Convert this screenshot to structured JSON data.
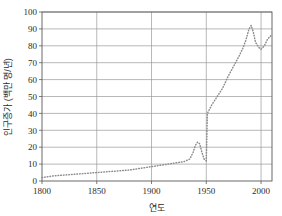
{
  "chart_data": {
    "type": "line",
    "title": "",
    "xlabel": "연도",
    "ylabel": "인구증가 (백만 명/년)",
    "xlim": [
      1800,
      2010
    ],
    "ylim": [
      0,
      100
    ],
    "xticks": [
      1800,
      1850,
      1900,
      1950,
      2000
    ],
    "yticks": [
      0,
      10,
      20,
      30,
      40,
      50,
      60,
      70,
      80,
      90,
      100
    ],
    "grid": "horizontal-and-vertical",
    "legend": "none",
    "line_style": "dotted",
    "line_color": "#8d8d8d",
    "series": [
      {
        "name": "연간 세계 인구증가",
        "x": [
          1800,
          1810,
          1820,
          1830,
          1840,
          1850,
          1860,
          1870,
          1880,
          1890,
          1900,
          1905,
          1910,
          1915,
          1920,
          1925,
          1930,
          1935,
          1938,
          1940,
          1942,
          1944,
          1946,
          1948,
          1950,
          1951,
          1955,
          1960,
          1965,
          1970,
          1975,
          1980,
          1983,
          1986,
          1989,
          1991,
          1993,
          1995,
          1998,
          2000,
          2003,
          2006,
          2009
        ],
        "values": [
          2,
          3,
          3.5,
          4,
          4.5,
          5,
          5.5,
          6,
          6.5,
          7.5,
          8.5,
          9,
          9.5,
          10,
          10.5,
          11,
          11.5,
          13,
          17,
          21,
          23,
          22,
          17,
          13,
          12,
          40,
          45,
          50,
          55,
          62,
          68,
          74,
          78,
          83,
          90,
          92,
          88,
          82,
          79,
          78,
          80,
          84,
          86
        ]
      }
    ]
  },
  "axis": {
    "y_tick_labels": [
      "100",
      "90",
      "80",
      "70",
      "60",
      "50",
      "40",
      "30",
      "20",
      "10",
      "0"
    ],
    "x_tick_labels": [
      "1800",
      "1850",
      "1900",
      "1950",
      "2000"
    ]
  }
}
